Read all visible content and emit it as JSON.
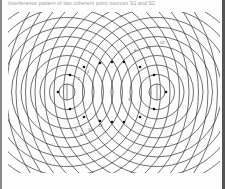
{
  "figure": {
    "caption": "Interference pattern of two coherent point sources S1 and S2",
    "sources": [
      {
        "name": "S1",
        "cx": 67,
        "cy": 92
      },
      {
        "name": "S2",
        "cx": 157,
        "cy": 92
      }
    ],
    "ring_spacing": 9.5,
    "ring_count": 16,
    "clip": {
      "x": 8,
      "y": 12,
      "w": 212,
      "h": 161
    },
    "line_color": "#333333",
    "node_color": "#111111",
    "nodes": [
      [
        58,
        92
      ],
      [
        70,
        75
      ],
      [
        84,
        67
      ],
      [
        100,
        63
      ],
      [
        112,
        62
      ],
      [
        124,
        62
      ],
      [
        140,
        67
      ],
      [
        154,
        75
      ],
      [
        166,
        92
      ],
      [
        154,
        109
      ],
      [
        140,
        117
      ],
      [
        124,
        122
      ],
      [
        112,
        122
      ],
      [
        100,
        121
      ],
      [
        84,
        117
      ],
      [
        70,
        109
      ]
    ],
    "labels": [
      {
        "text": "1",
        "x": 71,
        "y": 86
      },
      {
        "text": "2",
        "x": 78,
        "y": 80
      },
      {
        "text": "4",
        "x": 87,
        "y": 73
      },
      {
        "text": "8",
        "x": 134,
        "y": 52
      },
      {
        "text": "10",
        "x": 146,
        "y": 49
      },
      {
        "text": "12",
        "x": 160,
        "y": 44
      },
      {
        "text": "1",
        "x": 149,
        "y": 94
      },
      {
        "text": "3",
        "x": 128,
        "y": 101
      },
      {
        "text": "5",
        "x": 75,
        "y": 131
      },
      {
        "text": "8",
        "x": 80,
        "y": 136
      },
      {
        "text": "10",
        "x": 88,
        "y": 131
      },
      {
        "text": "12",
        "x": 98,
        "y": 127
      }
    ]
  }
}
